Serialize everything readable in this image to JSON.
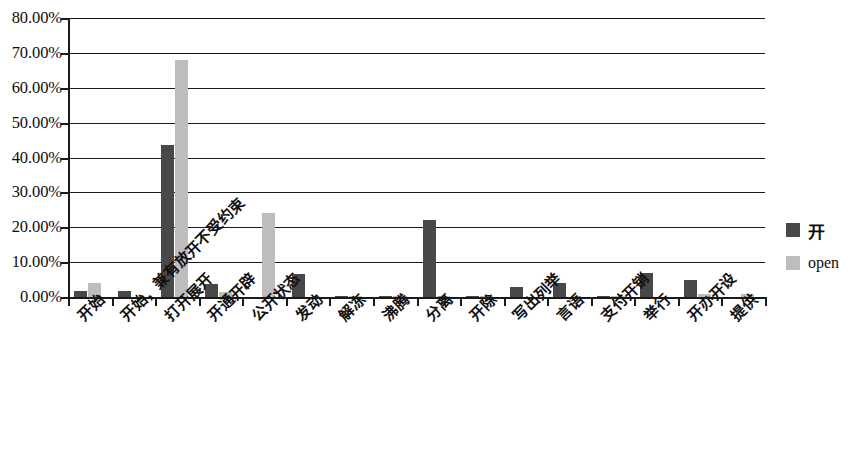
{
  "chart_data": {
    "type": "bar",
    "title": "",
    "xlabel": "",
    "ylabel": "",
    "ylim": [
      0,
      80
    ],
    "grid": true,
    "legend_position": "right",
    "ytick_labels": [
      "80.00%",
      "70.00%",
      "60.00%",
      "50.00%",
      "40.00%",
      "30.00%",
      "20.00%",
      "10.00%",
      "0.00%"
    ],
    "ytick_values": [
      80,
      70,
      60,
      50,
      40,
      30,
      20,
      10,
      0
    ],
    "categories": [
      "开始",
      "开始，兼有放开不受约束",
      "打开展开",
      "开通开辟",
      "公开状态",
      "发动",
      "解冻",
      "沸腾",
      "分离",
      "开除",
      "写出列举",
      "言语",
      "支付开销",
      "举行",
      "开办开设",
      "提供"
    ],
    "series": [
      {
        "name": "开",
        "color": "#484848",
        "values": [
          1.8,
          1.6,
          43.5,
          3.8,
          0.0,
          6.5,
          0.4,
          0.3,
          22.0,
          0.4,
          2.9,
          4.0,
          0.4,
          6.9,
          5.0,
          0.0
        ]
      },
      {
        "name": "open",
        "color": "#bdbdbd",
        "values": [
          4.0,
          0.0,
          68.0,
          1.4,
          24.0,
          0.0,
          0.3,
          0.3,
          0.4,
          0.3,
          0.0,
          0.0,
          0.3,
          0.0,
          1.0,
          1.0
        ]
      }
    ]
  },
  "legend": {
    "items": [
      {
        "label": "开",
        "color": "#484848"
      },
      {
        "label": "open",
        "color": "#bdbdbd"
      }
    ]
  }
}
